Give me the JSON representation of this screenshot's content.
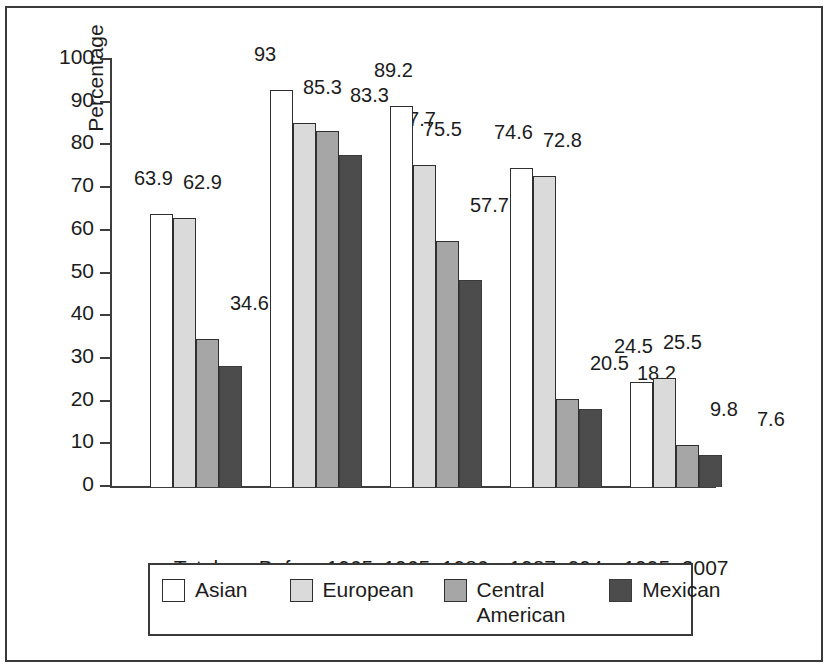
{
  "chart_data": {
    "type": "bar",
    "title": "",
    "xlabel": "",
    "ylabel": "Percentage",
    "ylim": [
      0,
      100
    ],
    "ytick_step": 10,
    "yticks": [
      "100",
      "90",
      "80",
      "70",
      "60",
      "50",
      "40",
      "30",
      "20",
      "10",
      "0"
    ],
    "grid": false,
    "legend_position": "bottom",
    "categories": [
      "Total",
      "Before 1965",
      "1965–1986",
      "1987–994",
      "1995–2007"
    ],
    "series": [
      {
        "name": "Asian",
        "color": "#ffffff",
        "values": [
          63.9,
          93,
          89.2,
          74.6,
          24.5
        ],
        "labels": [
          "63.9",
          "93",
          "89.2",
          "74.6",
          "24.5"
        ]
      },
      {
        "name": "European",
        "color": "#dadada",
        "values": [
          62.9,
          85.3,
          75.5,
          72.8,
          25.5
        ],
        "labels": [
          "62.9",
          "85.3",
          "75.5",
          "72.8",
          "25.5"
        ]
      },
      {
        "name": "Central American",
        "color": "#a6a6a6",
        "values": [
          34.6,
          83.3,
          57.7,
          20.5,
          9.8
        ],
        "labels": [
          "34.6",
          "83.3",
          "57.7",
          "20.5",
          "9.8"
        ]
      },
      {
        "name": "Mexican",
        "color": "#4c4c4c",
        "values": [
          28.3,
          77.7,
          48.4,
          18.2,
          7.6
        ],
        "labels": [
          "28.3",
          "77.7",
          "48.4",
          "18.2",
          "7.6"
        ]
      }
    ]
  },
  "legend": {
    "items": [
      {
        "label": "Asian",
        "swatch": "white-swatch"
      },
      {
        "label": "European",
        "swatch": "light-gray-swatch"
      },
      {
        "label": "Central American",
        "swatch": "medium-gray-swatch"
      },
      {
        "label": "Mexican",
        "swatch": "dark-gray-swatch"
      }
    ]
  }
}
